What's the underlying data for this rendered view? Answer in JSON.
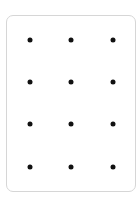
{
  "card": {
    "border_color": "#d6d6d6",
    "background": "#ffffff"
  },
  "dot_grid": {
    "columns": 3,
    "rows": 4,
    "dot_color": "#111111",
    "col_x": [
      30,
      71,
      113
    ],
    "row_y": [
      40,
      82,
      124,
      167
    ]
  }
}
